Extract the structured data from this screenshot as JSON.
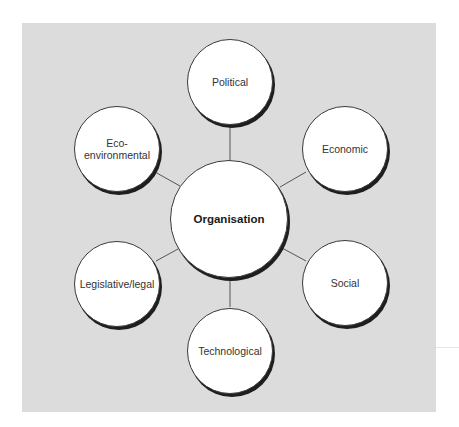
{
  "diagram": {
    "center": {
      "label": "Organisation",
      "cx": 229,
      "cy": 219,
      "r": 59
    },
    "nodes": [
      {
        "id": "political",
        "label": "Political",
        "cx": 230,
        "cy": 82,
        "r": 43
      },
      {
        "id": "economic",
        "label": "Economic",
        "cx": 345,
        "cy": 149,
        "r": 43
      },
      {
        "id": "social",
        "label": "Social",
        "cx": 345,
        "cy": 283,
        "r": 43
      },
      {
        "id": "technological",
        "label": "Technological",
        "cx": 230,
        "cy": 351,
        "r": 43
      },
      {
        "id": "legislative-legal",
        "label": "Legislative/legal",
        "cx": 117,
        "cy": 284,
        "r": 43
      },
      {
        "id": "eco-environmental",
        "label": "Eco-\nenvironmental",
        "cx": 117,
        "cy": 149,
        "r": 43
      }
    ],
    "colors": {
      "panel": "#dcdcdc",
      "node_fill": "#ffffff",
      "node_border": "#3a3a3a",
      "connector": "#555555"
    }
  }
}
